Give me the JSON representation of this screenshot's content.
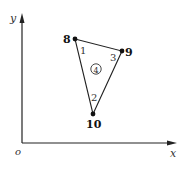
{
  "axes": {
    "origin_label": "o",
    "x_label": "x",
    "y_label": "y"
  },
  "nodes": [
    {
      "id": "8",
      "label": "8",
      "x": 75,
      "y": 39
    },
    {
      "id": "9",
      "label": "9",
      "x": 122,
      "y": 51
    },
    {
      "id": "10",
      "label": "10",
      "x": 93,
      "y": 114
    }
  ],
  "corner_labels": {
    "c1": "1",
    "c2": "2",
    "c3": "3"
  },
  "element": {
    "label": "④",
    "number": "4"
  },
  "colors": {
    "line": "#222222",
    "text": "#111111",
    "node": "#111111"
  }
}
